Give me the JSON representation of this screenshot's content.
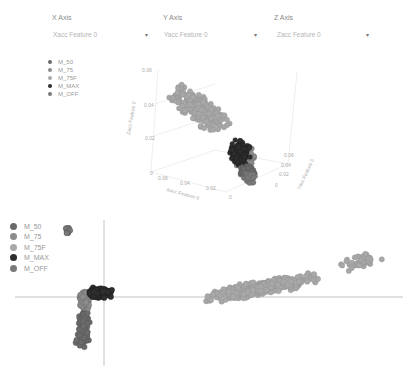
{
  "controls": {
    "x_axis": {
      "label": "X Axis",
      "value": "Xacc Feature 0"
    },
    "y_axis": {
      "label": "Y Axis",
      "value": "Yacc Feature 0"
    },
    "z_axis": {
      "label": "Z Axis",
      "value": "Zacc Feature 0"
    }
  },
  "legend": [
    {
      "label": "M_50",
      "color": "#6b6b6b"
    },
    {
      "label": "M_75",
      "color": "#8c8c8c"
    },
    {
      "label": "M_75F",
      "color": "#a8a8a8"
    },
    {
      "label": "M_MAX",
      "color": "#2e2e2e"
    },
    {
      "label": "M_OFF",
      "color": "#7a7a7a"
    }
  ],
  "chart_data": [
    {
      "type": "scatter3d",
      "title": "",
      "axes": {
        "x": {
          "label": "Xacc Feature 0",
          "ticks": [
            "0.06",
            "0.04",
            "0.02",
            "0"
          ]
        },
        "y": {
          "label": "Yacc Feature 0",
          "ticks": [
            "0",
            "0.02",
            "0.04",
            "0.06"
          ]
        },
        "z": {
          "label": "Zacc Feature 0",
          "ticks": [
            "0",
            "0.02",
            "0.04",
            "0.06"
          ]
        }
      },
      "series": [
        {
          "name": "M_50",
          "approx_center": [
            0.01,
            0.01,
            0.01
          ]
        },
        {
          "name": "M_75",
          "approx_center": [
            0.02,
            0.01,
            0.015
          ]
        },
        {
          "name": "M_75F",
          "approx_center": [
            0.045,
            0.02,
            0.035
          ]
        },
        {
          "name": "M_MAX",
          "approx_center": [
            0.015,
            0.015,
            0.015
          ]
        },
        {
          "name": "M_OFF",
          "approx_center": [
            0.01,
            0.01,
            0.01
          ]
        }
      ],
      "legend_position": "top-left"
    },
    {
      "type": "scatter",
      "title": "",
      "xlabel": "",
      "ylabel": "",
      "grid": false,
      "legend_position": "top-left",
      "series": [
        {
          "name": "M_50",
          "description": "small tight cluster near top-left at origin-left region"
        },
        {
          "name": "M_75",
          "description": "cluster left of vertical axis extending downward"
        },
        {
          "name": "M_75F",
          "description": "elongated cluster to the right rising upward"
        },
        {
          "name": "M_MAX",
          "description": "dense cluster just right of origin, above x-axis"
        },
        {
          "name": "M_OFF",
          "description": "cluster around origin extending below"
        }
      ]
    }
  ]
}
